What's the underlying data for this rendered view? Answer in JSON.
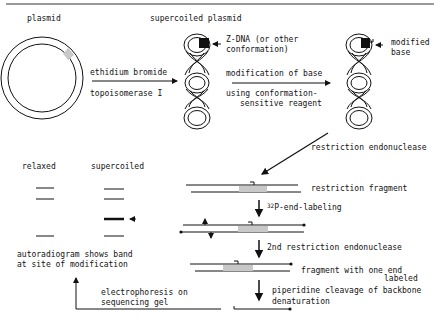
{
  "diagram": {
    "type": "flowchart",
    "title": "",
    "stages": {
      "plasmid": {
        "label": "plasmid"
      },
      "supercoiled": {
        "label": "supercoiled plasmid",
        "annotation": [
          "Z-DNA (or other",
          "conformation)"
        ]
      },
      "modified": {
        "annotation": [
          "modified",
          "base"
        ]
      }
    },
    "steps": {
      "step1_top": "ethidium bromide",
      "step1_bottom": "topoisomerase I",
      "step2_top": "modification of base",
      "step2_bottom_1": "using conformation-",
      "step2_bottom_2": "sensitive reagent",
      "step3": "restriction endonuclease",
      "fragment_label": "restriction fragment",
      "step4_sup": "32",
      "step4": "P-end-labeling",
      "step5": "2nd restriction endonuclease",
      "fragment2_line1": "fragment with one end",
      "fragment2_line2": "labeled",
      "step6_line1": "piperidine cleavage of backbone",
      "step6_line2": "denaturation",
      "step7_line1": "electrophoresis on",
      "step7_line2": "sequencing gel"
    },
    "gel": {
      "lanes": [
        {
          "label": "relaxed",
          "bands": 3
        },
        {
          "label": "supercoiled",
          "bands": 4,
          "highlighted_band": 3
        }
      ],
      "result_line1": "autoradiogram shows band",
      "result_line2": "at site of modification"
    },
    "colors": {
      "ink": "#111111",
      "shade": "#c8c8c8",
      "background": "#ffffff"
    }
  }
}
